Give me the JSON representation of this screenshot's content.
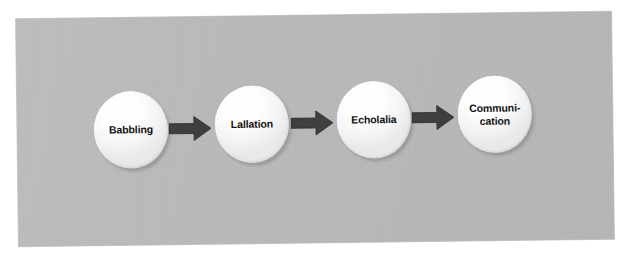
{
  "diagram": {
    "type": "linear-process-flow",
    "title": "",
    "background_color": "#b9b9b9",
    "node_fill_color": "#fbfbfb",
    "arrow_color": "#3f3f3f",
    "text_color": "#121212",
    "nodes": [
      {
        "id": "node-1",
        "label": "Babbling",
        "shape": "circle"
      },
      {
        "id": "node-2",
        "label": "Lallation",
        "shape": "circle"
      },
      {
        "id": "node-3",
        "label": "Echolalia",
        "shape": "circle"
      },
      {
        "id": "node-4",
        "label": "Communi-\ncation",
        "shape": "circle"
      }
    ],
    "arrows": [
      {
        "id": "arrow-1",
        "from": "node-1",
        "to": "node-2",
        "direction": "right",
        "style": "block-arrow"
      },
      {
        "id": "arrow-2",
        "from": "node-2",
        "to": "node-3",
        "direction": "right",
        "style": "block-arrow"
      },
      {
        "id": "arrow-3",
        "from": "node-3",
        "to": "node-4",
        "direction": "right",
        "style": "block-arrow"
      }
    ]
  }
}
